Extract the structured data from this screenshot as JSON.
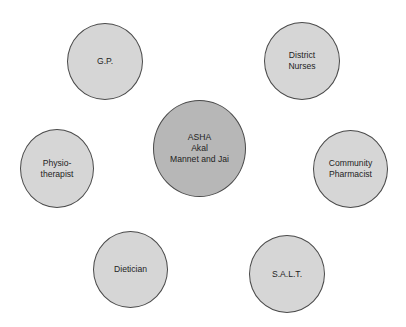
{
  "diagram": {
    "center": {
      "label": "ASHA\nAkal\nMannet and Jai"
    },
    "nodes": [
      {
        "id": "gp",
        "label": "G.P."
      },
      {
        "id": "district-nurses",
        "label": "District\nNurses"
      },
      {
        "id": "physiotherapist",
        "label": "Physio-\ntherapist"
      },
      {
        "id": "community-pharmacist",
        "label": "Community\nPharmacist"
      },
      {
        "id": "dietician",
        "label": "Dietician"
      },
      {
        "id": "salt",
        "label": "S.A.L.T."
      }
    ],
    "colors": {
      "center_fill": "#b7b7b7",
      "node_fill": "#d6d6d6",
      "outline": "#4a4a4a",
      "text": "#1e1e1e"
    }
  }
}
